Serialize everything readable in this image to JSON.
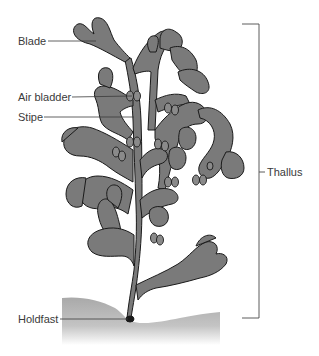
{
  "diagram": {
    "labels": {
      "blade": "Blade",
      "air_bladder": "Air bladder",
      "stipe": "Stipe",
      "holdfast": "Holdfast",
      "thallus": "Thallus"
    },
    "colors": {
      "frond_fill": "#7a7a7a",
      "outline": "#1a1a1a",
      "leader_line": "#3a3a3a",
      "ground": "#b5b5b5",
      "background": "#ffffff"
    }
  }
}
